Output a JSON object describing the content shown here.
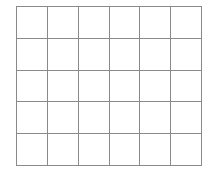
{
  "grid": {
    "rows": 5,
    "columns": 6,
    "line_color": "#8a8a8a",
    "background": "#ffffff"
  }
}
